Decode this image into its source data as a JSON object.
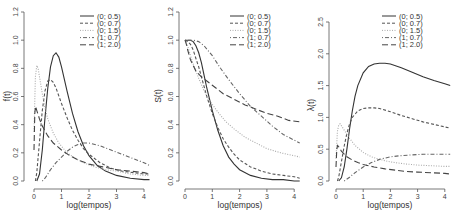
{
  "chart_data": [
    {
      "type": "line",
      "title": "",
      "xlabel": "log(tempos)",
      "ylabel": "f(t)",
      "xlim": [
        0,
        4.2
      ],
      "ylim": [
        0,
        1.2
      ],
      "xticks": [
        "0",
        "1",
        "2",
        "3",
        "4"
      ],
      "yticks": [
        "0.0",
        "0.2",
        "0.4",
        "0.6",
        "0.8",
        "1.0",
        "1.2"
      ],
      "grid": false,
      "legend_position": "top-right",
      "series": [
        {
          "name": "(0; 0.5)",
          "style": "solid",
          "x": [
            0.1,
            0.2,
            0.3,
            0.4,
            0.5,
            0.6,
            0.7,
            0.8,
            0.9,
            1.0,
            1.2,
            1.4,
            1.6,
            1.8,
            2.0,
            2.3,
            2.6,
            3.0,
            3.5,
            4.0,
            4.2
          ],
          "y": [
            0.0,
            0.05,
            0.22,
            0.45,
            0.66,
            0.81,
            0.89,
            0.91,
            0.88,
            0.81,
            0.64,
            0.48,
            0.35,
            0.25,
            0.18,
            0.11,
            0.07,
            0.04,
            0.02,
            0.01,
            0.01
          ]
        },
        {
          "name": "(0; 0.7)",
          "style": "dashed",
          "x": [
            0.05,
            0.1,
            0.2,
            0.3,
            0.4,
            0.5,
            0.6,
            0.7,
            0.8,
            1.0,
            1.2,
            1.4,
            1.6,
            1.8,
            2.0,
            2.4,
            2.8,
            3.2,
            3.6,
            4.0,
            4.2
          ],
          "y": [
            0.0,
            0.06,
            0.28,
            0.5,
            0.64,
            0.71,
            0.72,
            0.7,
            0.66,
            0.55,
            0.45,
            0.36,
            0.29,
            0.23,
            0.19,
            0.13,
            0.09,
            0.07,
            0.06,
            0.05,
            0.05
          ]
        },
        {
          "name": "(0; 1.5)",
          "style": "dotted",
          "x": [
            0.0,
            0.05,
            0.1,
            0.15,
            0.2,
            0.3,
            0.4,
            0.5,
            0.7,
            0.9,
            1.2,
            1.5,
            1.8,
            2.2,
            2.6,
            3.0,
            3.5,
            4.0,
            4.2
          ],
          "y": [
            0.35,
            0.74,
            0.82,
            0.8,
            0.74,
            0.62,
            0.52,
            0.44,
            0.34,
            0.27,
            0.2,
            0.16,
            0.13,
            0.1,
            0.08,
            0.07,
            0.05,
            0.04,
            0.04
          ]
        },
        {
          "name": "(1; 0.7)",
          "style": "dotdash",
          "x": [
            0.3,
            0.4,
            0.5,
            0.6,
            0.8,
            1.0,
            1.2,
            1.4,
            1.6,
            1.8,
            2.0,
            2.4,
            2.8,
            3.2,
            3.6,
            4.0,
            4.2
          ],
          "y": [
            0.0,
            0.02,
            0.05,
            0.08,
            0.13,
            0.17,
            0.21,
            0.24,
            0.26,
            0.27,
            0.27,
            0.25,
            0.22,
            0.19,
            0.16,
            0.13,
            0.11
          ]
        },
        {
          "name": "(1; 2.0)",
          "style": "longdash",
          "x": [
            0.0,
            0.03,
            0.06,
            0.1,
            0.2,
            0.3,
            0.5,
            0.7,
            1.0,
            1.3,
            1.6,
            2.0,
            2.5,
            3.0,
            3.5,
            4.0,
            4.2
          ],
          "y": [
            0.22,
            0.48,
            0.53,
            0.5,
            0.44,
            0.39,
            0.32,
            0.27,
            0.22,
            0.18,
            0.15,
            0.12,
            0.1,
            0.08,
            0.07,
            0.06,
            0.05
          ]
        }
      ]
    },
    {
      "type": "line",
      "title": "",
      "xlabel": "log(tempos)",
      "ylabel": "S(t)",
      "xlim": [
        0,
        4.2
      ],
      "ylim": [
        0,
        1.2
      ],
      "xticks": [
        "0",
        "1",
        "2",
        "3",
        "4"
      ],
      "yticks": [
        "0.0",
        "0.2",
        "0.4",
        "0.6",
        "0.8",
        "1.0",
        "1.2"
      ],
      "grid": false,
      "legend_position": "top-right",
      "series": [
        {
          "name": "(0; 0.5)",
          "style": "solid",
          "x": [
            0.0,
            0.2,
            0.3,
            0.4,
            0.5,
            0.6,
            0.7,
            0.8,
            0.9,
            1.0,
            1.2,
            1.4,
            1.6,
            1.8,
            2.0,
            2.4,
            2.8,
            3.2,
            3.6,
            4.0,
            4.2
          ],
          "y": [
            1.0,
            1.0,
            0.99,
            0.96,
            0.91,
            0.84,
            0.75,
            0.66,
            0.58,
            0.5,
            0.36,
            0.25,
            0.17,
            0.12,
            0.08,
            0.04,
            0.02,
            0.01,
            0.01,
            0.0,
            0.0
          ]
        },
        {
          "name": "(0; 0.7)",
          "style": "dashed",
          "x": [
            0.0,
            0.1,
            0.2,
            0.3,
            0.4,
            0.5,
            0.6,
            0.7,
            0.8,
            1.0,
            1.2,
            1.4,
            1.6,
            1.8,
            2.0,
            2.4,
            2.8,
            3.2,
            3.6,
            4.0,
            4.2
          ],
          "y": [
            1.0,
            0.99,
            0.97,
            0.93,
            0.87,
            0.81,
            0.74,
            0.67,
            0.6,
            0.48,
            0.38,
            0.3,
            0.24,
            0.19,
            0.15,
            0.1,
            0.07,
            0.05,
            0.04,
            0.03,
            0.02
          ]
        },
        {
          "name": "(0; 1.5)",
          "style": "dotted",
          "x": [
            0.0,
            0.1,
            0.2,
            0.3,
            0.5,
            0.7,
            0.9,
            1.2,
            1.5,
            1.8,
            2.2,
            2.6,
            3.0,
            3.5,
            4.0,
            4.2
          ],
          "y": [
            1.0,
            0.96,
            0.89,
            0.83,
            0.73,
            0.64,
            0.57,
            0.49,
            0.42,
            0.37,
            0.31,
            0.27,
            0.23,
            0.2,
            0.18,
            0.17
          ]
        },
        {
          "name": "(1; 0.7)",
          "style": "dotdash",
          "x": [
            0.0,
            0.3,
            0.5,
            0.7,
            1.0,
            1.3,
            1.6,
            2.0,
            2.4,
            2.8,
            3.2,
            3.6,
            4.0,
            4.2
          ],
          "y": [
            1.0,
            1.0,
            0.99,
            0.96,
            0.89,
            0.8,
            0.72,
            0.62,
            0.53,
            0.46,
            0.39,
            0.33,
            0.29,
            0.27
          ]
        },
        {
          "name": "(1; 2.0)",
          "style": "longdash",
          "x": [
            0.0,
            0.05,
            0.1,
            0.2,
            0.4,
            0.6,
            0.8,
            1.0,
            1.4,
            1.8,
            2.2,
            2.6,
            3.0,
            3.4,
            3.8,
            4.2
          ],
          "y": [
            1.0,
            0.97,
            0.93,
            0.86,
            0.78,
            0.74,
            0.71,
            0.68,
            0.62,
            0.58,
            0.54,
            0.51,
            0.48,
            0.46,
            0.43,
            0.42
          ]
        }
      ]
    },
    {
      "type": "line",
      "title": "",
      "xlabel": "log(tempos)",
      "ylabel": "λ(t)",
      "xlim": [
        0,
        4.2
      ],
      "ylim": [
        0,
        2.5
      ],
      "xticks": [
        "0",
        "1",
        "2",
        "3",
        "4"
      ],
      "yticks": [
        "0.0",
        "0.5",
        "1.0",
        "1.5",
        "2.0",
        "2.5"
      ],
      "grid": false,
      "legend_position": "top-right",
      "series": [
        {
          "name": "(0; 0.5)",
          "style": "solid",
          "x": [
            0.1,
            0.2,
            0.3,
            0.4,
            0.5,
            0.6,
            0.7,
            0.8,
            1.0,
            1.2,
            1.4,
            1.6,
            1.8,
            2.0,
            2.4,
            2.8,
            3.2,
            3.6,
            4.0,
            4.2
          ],
          "y": [
            0.0,
            0.05,
            0.22,
            0.5,
            0.82,
            1.1,
            1.33,
            1.5,
            1.7,
            1.8,
            1.84,
            1.85,
            1.85,
            1.84,
            1.78,
            1.71,
            1.64,
            1.58,
            1.53,
            1.5
          ]
        },
        {
          "name": "(0; 0.7)",
          "style": "dashed",
          "x": [
            0.05,
            0.1,
            0.2,
            0.3,
            0.4,
            0.5,
            0.6,
            0.8,
            1.0,
            1.2,
            1.4,
            1.6,
            2.0,
            2.4,
            2.8,
            3.2,
            3.6,
            4.0,
            4.2
          ],
          "y": [
            0.0,
            0.06,
            0.3,
            0.55,
            0.75,
            0.9,
            1.0,
            1.1,
            1.14,
            1.15,
            1.15,
            1.14,
            1.09,
            1.03,
            0.98,
            0.93,
            0.89,
            0.85,
            0.83
          ]
        },
        {
          "name": "(0; 1.5)",
          "style": "dotted",
          "x": [
            0.0,
            0.05,
            0.1,
            0.15,
            0.2,
            0.3,
            0.5,
            0.7,
            1.0,
            1.3,
            1.6,
            2.0,
            2.5,
            3.0,
            3.5,
            4.0,
            4.2
          ],
          "y": [
            0.35,
            0.78,
            0.88,
            0.9,
            0.87,
            0.8,
            0.67,
            0.56,
            0.45,
            0.38,
            0.34,
            0.3,
            0.27,
            0.25,
            0.24,
            0.23,
            0.23
          ]
        },
        {
          "name": "(1; 0.7)",
          "style": "dotdash",
          "x": [
            0.3,
            0.5,
            0.7,
            1.0,
            1.3,
            1.6,
            2.0,
            2.4,
            2.8,
            3.2,
            3.6,
            4.0,
            4.2
          ],
          "y": [
            0.0,
            0.06,
            0.13,
            0.22,
            0.29,
            0.34,
            0.38,
            0.4,
            0.41,
            0.42,
            0.42,
            0.42,
            0.42
          ]
        },
        {
          "name": "(1; 2.0)",
          "style": "longdash",
          "x": [
            0.0,
            0.03,
            0.06,
            0.1,
            0.2,
            0.4,
            0.6,
            0.8,
            1.0,
            1.4,
            1.8,
            2.2,
            2.6,
            3.0,
            3.5,
            4.0,
            4.2
          ],
          "y": [
            0.22,
            0.5,
            0.56,
            0.54,
            0.47,
            0.38,
            0.33,
            0.29,
            0.26,
            0.22,
            0.19,
            0.17,
            0.15,
            0.14,
            0.13,
            0.12,
            0.11
          ]
        }
      ]
    }
  ],
  "panels": [
    {
      "ylabel": "f(t)",
      "xlabel": "log(tempos)"
    },
    {
      "ylabel": "S(t)",
      "xlabel": "log(tempos)"
    },
    {
      "ylabel": "λ(t)",
      "xlabel": "log(tempos)"
    }
  ],
  "legend": [
    "(0; 0.5)",
    "(0; 0.7)",
    "(0; 1.5)",
    "(1; 0.7)",
    "(1; 2.0)"
  ],
  "styles": {
    "solid": {
      "color": "#333333",
      "dash": ""
    },
    "dashed": {
      "color": "#555555",
      "dash": "3,2"
    },
    "dotted": {
      "color": "#aaaaaa",
      "dash": "1,1.5"
    },
    "dotdash": {
      "color": "#666666",
      "dash": "1,2,4,2"
    },
    "longdash": {
      "color": "#444444",
      "dash": "6,3"
    }
  }
}
